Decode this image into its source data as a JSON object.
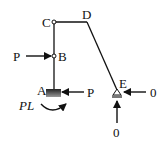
{
  "diagram": {
    "type": "structural-frame-free-body",
    "nodes": {
      "A": {
        "label": "A",
        "support": "fixed"
      },
      "B": {
        "label": "B",
        "joint": "hinge"
      },
      "C": {
        "label": "C",
        "joint": "hinge"
      },
      "D": {
        "label": "D"
      },
      "E": {
        "label": "E",
        "support": "pin"
      }
    },
    "members": [
      {
        "from": "A",
        "to": "B"
      },
      {
        "from": "B",
        "to": "C"
      },
      {
        "from": "C",
        "to": "D"
      },
      {
        "from": "D",
        "to": "E"
      }
    ],
    "loads": {
      "B_horizontal": {
        "label": "P",
        "direction": "right"
      },
      "A_horizontal": {
        "label": "P",
        "direction": "left"
      },
      "A_moment": {
        "label": "PL",
        "direction": "clockwise"
      },
      "E_horizontal": {
        "label": "0",
        "direction": "left"
      },
      "E_vertical": {
        "label": "0",
        "direction": "up"
      }
    }
  }
}
